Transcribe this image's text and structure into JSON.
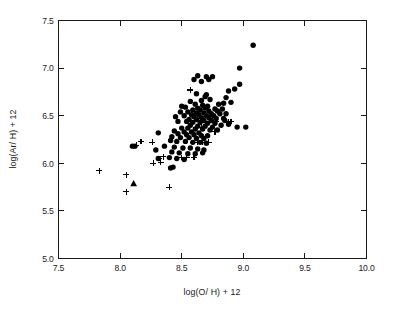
{
  "chart_data": {
    "type": "scatter",
    "title": "",
    "xlabel": "log(O/ H) + 12",
    "ylabel": "log(Ar/ H) + 12",
    "xlim": [
      7.5,
      10.0
    ],
    "ylim": [
      5.0,
      7.5
    ],
    "xticks": [
      "7.5",
      "8.0",
      "8.5",
      "9.0",
      "9.5",
      "10.0"
    ],
    "xtick_values": [
      7.5,
      8.0,
      8.5,
      9.0,
      9.5,
      10.0
    ],
    "yticks": [
      "5.0",
      "5.5",
      "6.0",
      "6.5",
      "7.0",
      "7.5"
    ],
    "ytick_values": [
      5.0,
      5.5,
      6.0,
      6.5,
      7.0,
      7.5
    ],
    "grid": false,
    "legend": "none",
    "frame": "box-all-sides-inward-ticks",
    "series": [
      {
        "name": "filled-circle",
        "marker": "circle",
        "color": "#000000",
        "points": [
          [
            9.08,
            7.24
          ],
          [
            8.97,
            7.0
          ],
          [
            8.63,
            6.92
          ],
          [
            8.7,
            6.91
          ],
          [
            8.75,
            6.91
          ],
          [
            8.72,
            6.88
          ],
          [
            8.6,
            6.88
          ],
          [
            8.66,
            6.86
          ],
          [
            8.97,
            6.83
          ],
          [
            8.93,
            6.78
          ],
          [
            8.88,
            6.76
          ],
          [
            8.62,
            6.73
          ],
          [
            8.7,
            6.72
          ],
          [
            8.69,
            6.7
          ],
          [
            8.86,
            6.69
          ],
          [
            8.73,
            6.67
          ],
          [
            8.66,
            6.66
          ],
          [
            8.57,
            6.65
          ],
          [
            8.9,
            6.64
          ],
          [
            8.84,
            6.63
          ],
          [
            8.8,
            6.62
          ],
          [
            8.61,
            6.62
          ],
          [
            8.67,
            6.61
          ],
          [
            8.71,
            6.6
          ],
          [
            8.5,
            6.6
          ],
          [
            8.53,
            6.59
          ],
          [
            8.63,
            6.58
          ],
          [
            8.69,
            6.58
          ],
          [
            8.77,
            6.57
          ],
          [
            8.83,
            6.57
          ],
          [
            8.59,
            6.56
          ],
          [
            8.65,
            6.56
          ],
          [
            8.72,
            6.55
          ],
          [
            8.79,
            6.55
          ],
          [
            8.49,
            6.54
          ],
          [
            8.55,
            6.54
          ],
          [
            8.62,
            6.53
          ],
          [
            8.68,
            6.53
          ],
          [
            8.74,
            6.52
          ],
          [
            8.81,
            6.52
          ],
          [
            8.86,
            6.52
          ],
          [
            8.58,
            6.51
          ],
          [
            8.64,
            6.51
          ],
          [
            8.7,
            6.5
          ],
          [
            8.76,
            6.5
          ],
          [
            8.52,
            6.5
          ],
          [
            8.45,
            6.49
          ],
          [
            8.6,
            6.49
          ],
          [
            8.66,
            6.48
          ],
          [
            8.72,
            6.48
          ],
          [
            8.78,
            6.47
          ],
          [
            8.84,
            6.47
          ],
          [
            8.56,
            6.46
          ],
          [
            8.62,
            6.46
          ],
          [
            8.68,
            6.45
          ],
          [
            8.74,
            6.45
          ],
          [
            8.47,
            6.44
          ],
          [
            8.54,
            6.44
          ],
          [
            8.59,
            6.43
          ],
          [
            8.65,
            6.43
          ],
          [
            8.71,
            6.42
          ],
          [
            8.77,
            6.42
          ],
          [
            8.88,
            6.41
          ],
          [
            8.82,
            6.4
          ],
          [
            8.57,
            6.4
          ],
          [
            8.63,
            6.39
          ],
          [
            8.69,
            6.39
          ],
          [
            8.75,
            6.38
          ],
          [
            8.95,
            6.38
          ],
          [
            9.02,
            6.38
          ],
          [
            8.5,
            6.37
          ],
          [
            8.55,
            6.37
          ],
          [
            8.61,
            6.36
          ],
          [
            8.67,
            6.36
          ],
          [
            8.73,
            6.35
          ],
          [
            8.79,
            6.35
          ],
          [
            8.85,
            6.45
          ],
          [
            8.44,
            6.34
          ],
          [
            8.52,
            6.33
          ],
          [
            8.58,
            6.33
          ],
          [
            8.64,
            6.32
          ],
          [
            8.31,
            6.32
          ],
          [
            8.47,
            6.31
          ],
          [
            8.54,
            6.3
          ],
          [
            8.6,
            6.3
          ],
          [
            8.66,
            6.29
          ],
          [
            8.71,
            6.29
          ],
          [
            8.42,
            6.28
          ],
          [
            8.49,
            6.27
          ],
          [
            8.56,
            6.27
          ],
          [
            8.62,
            6.26
          ],
          [
            8.68,
            6.26
          ],
          [
            8.12,
            6.18
          ],
          [
            8.1,
            6.18
          ],
          [
            8.29,
            6.14
          ],
          [
            8.41,
            6.24
          ],
          [
            8.46,
            6.23
          ],
          [
            8.53,
            6.23
          ],
          [
            8.59,
            6.22
          ],
          [
            8.65,
            6.22
          ],
          [
            8.7,
            6.21
          ],
          [
            8.36,
            6.18
          ],
          [
            8.44,
            6.17
          ],
          [
            8.51,
            6.16
          ],
          [
            8.57,
            6.16
          ],
          [
            8.63,
            6.15
          ],
          [
            8.68,
            6.14
          ],
          [
            8.42,
            6.12
          ],
          [
            8.48,
            6.11
          ],
          [
            8.55,
            6.1
          ],
          [
            8.61,
            6.1
          ],
          [
            8.67,
            6.11
          ],
          [
            8.4,
            6.06
          ],
          [
            8.46,
            6.05
          ],
          [
            8.52,
            6.04
          ],
          [
            8.43,
            5.96
          ],
          [
            8.41,
            5.95
          ],
          [
            8.31,
            6.05
          ]
        ]
      },
      {
        "name": "plus",
        "marker": "plus",
        "color": "#000000",
        "points": [
          [
            7.83,
            5.92
          ],
          [
            8.05,
            5.88
          ],
          [
            8.05,
            5.7
          ],
          [
            8.13,
            6.19
          ],
          [
            8.17,
            6.23
          ],
          [
            8.26,
            6.22
          ],
          [
            8.27,
            6.0
          ],
          [
            8.33,
            6.01
          ],
          [
            8.32,
            6.05
          ],
          [
            8.35,
            6.07
          ],
          [
            8.4,
            5.75
          ],
          [
            8.5,
            6.06
          ],
          [
            8.54,
            6.06
          ],
          [
            8.57,
            6.77
          ],
          [
            8.6,
            6.06
          ],
          [
            8.63,
            6.22
          ],
          [
            8.67,
            6.22
          ],
          [
            8.72,
            6.22
          ],
          [
            8.78,
            6.44
          ],
          [
            8.88,
            6.44
          ],
          [
            8.9,
            6.44
          ],
          [
            8.77,
            6.33
          ],
          [
            8.66,
            6.38
          ]
        ]
      },
      {
        "name": "triangle",
        "marker": "triangle",
        "color": "#000000",
        "points": [
          [
            8.11,
            5.79
          ]
        ]
      }
    ]
  }
}
